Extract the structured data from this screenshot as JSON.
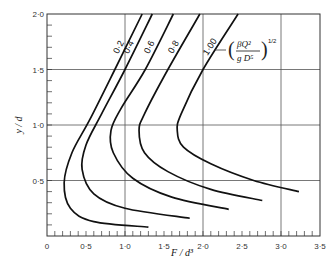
{
  "chart_data": {
    "type": "line",
    "title": "",
    "xlabel": "F / d³",
    "ylabel": "y / d",
    "xlim": [
      0,
      3.5
    ],
    "ylim": [
      0,
      2.0
    ],
    "grid": true,
    "x_ticks": [
      "0",
      "0·5",
      "1·0",
      "1·5",
      "2·0",
      "2·5",
      "3·0",
      "3·5"
    ],
    "x_tick_values": [
      0,
      0.5,
      1.0,
      1.5,
      2.0,
      2.5,
      3.0,
      3.5
    ],
    "y_ticks": [
      "0·5",
      "1·0",
      "1·5",
      "2·0"
    ],
    "y_tick_values": [
      0.5,
      1.0,
      1.5,
      2.0
    ],
    "parameter_label": "(βQ² / gD⁵)^1/2",
    "parameter": {
      "numerator": "βQ²",
      "denominator": "g D⁵",
      "exponent": "1/2"
    },
    "series": [
      {
        "name": "0·2",
        "points": [
          [
            1.22,
            2.0
          ],
          [
            0.87,
            1.5
          ],
          [
            0.55,
            1.05
          ],
          [
            0.32,
            0.75
          ],
          [
            0.22,
            0.48
          ],
          [
            0.3,
            0.25
          ],
          [
            0.6,
            0.13
          ],
          [
            1.3,
            0.08
          ]
        ]
      },
      {
        "name": "0·4",
        "points": [
          [
            1.35,
            2.0
          ],
          [
            1.0,
            1.5
          ],
          [
            0.7,
            1.1
          ],
          [
            0.5,
            0.82
          ],
          [
            0.45,
            0.6
          ],
          [
            0.6,
            0.38
          ],
          [
            1.0,
            0.25
          ],
          [
            1.83,
            0.16
          ]
        ]
      },
      {
        "name": "0·6",
        "points": [
          [
            1.62,
            2.0
          ],
          [
            1.26,
            1.5
          ],
          [
            0.95,
            1.15
          ],
          [
            0.82,
            0.95
          ],
          [
            0.85,
            0.75
          ],
          [
            1.1,
            0.52
          ],
          [
            1.6,
            0.35
          ],
          [
            2.33,
            0.24
          ]
        ]
      },
      {
        "name": "0·8",
        "points": [
          [
            1.96,
            2.0
          ],
          [
            1.55,
            1.5
          ],
          [
            1.25,
            1.1
          ],
          [
            1.18,
            0.95
          ],
          [
            1.25,
            0.75
          ],
          [
            1.55,
            0.58
          ],
          [
            2.1,
            0.42
          ],
          [
            2.76,
            0.32
          ]
        ]
      },
      {
        "name": "1·00",
        "points": [
          [
            2.45,
            2.0
          ],
          [
            2.0,
            1.5
          ],
          [
            1.72,
            1.1
          ],
          [
            1.67,
            0.95
          ],
          [
            1.75,
            0.8
          ],
          [
            2.1,
            0.65
          ],
          [
            2.65,
            0.5
          ],
          [
            3.23,
            0.4
          ]
        ]
      }
    ]
  }
}
